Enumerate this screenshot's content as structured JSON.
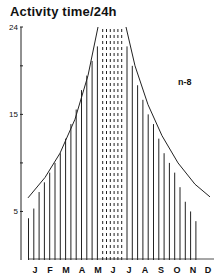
{
  "chart_data": {
    "type": "bar",
    "title": "Activity time/24h",
    "xlabel": "",
    "ylabel": "Activity time/24h",
    "ylim": [
      0,
      24
    ],
    "y_ticks": [
      5,
      15,
      24
    ],
    "grid": false,
    "months": [
      "J",
      "F",
      "M",
      "A",
      "M",
      "J",
      "J",
      "A",
      "S",
      "O",
      "N",
      "D"
    ],
    "annotation": "n-8",
    "series": [
      {
        "name": "left_bars",
        "values": [
          4.3,
          5.3,
          7.0,
          8.0,
          9.0,
          10.0,
          11.0,
          12.5,
          14.0,
          15.5,
          17.5,
          19.0,
          20.5,
          22.0
        ]
      },
      {
        "name": "dotted_24h",
        "values": [
          24,
          24,
          24,
          24,
          24,
          24
        ]
      },
      {
        "name": "right_bars",
        "values": [
          22.0,
          20.0,
          18.0,
          16.5,
          15.0,
          14.0,
          12.5,
          11.0,
          10.0,
          9.0,
          7.5,
          6.0,
          5.0,
          4.0
        ]
      }
    ]
  }
}
